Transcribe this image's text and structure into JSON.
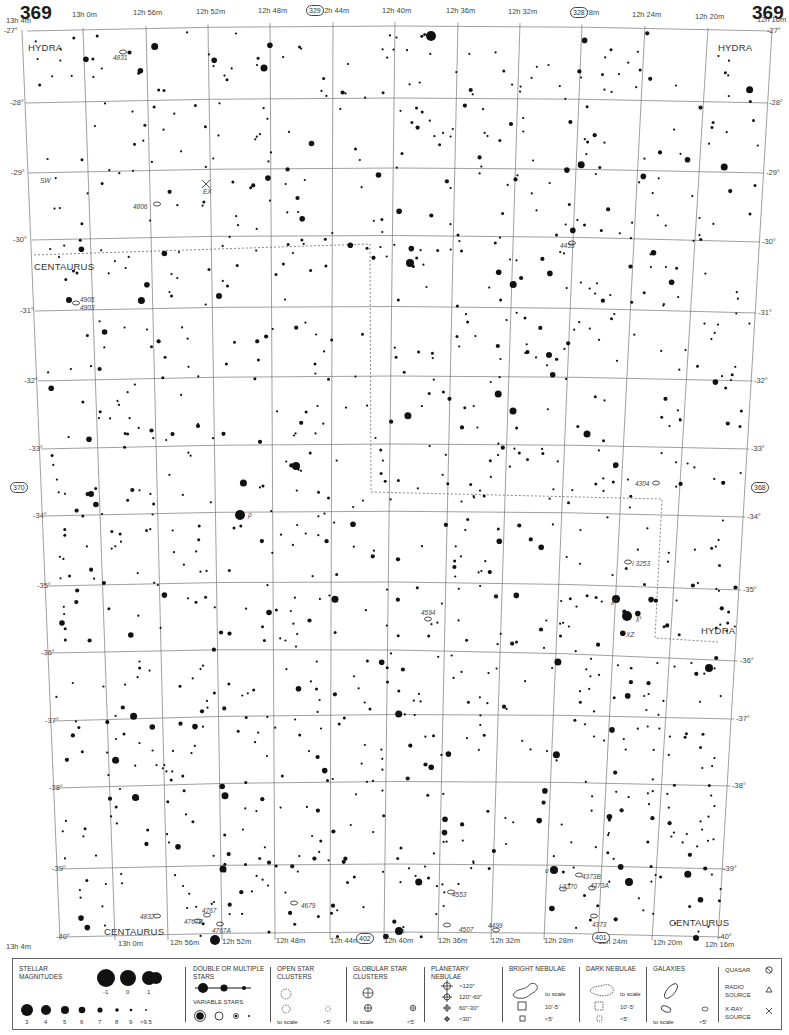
{
  "page": {
    "number_left": "369",
    "number_right": "369"
  },
  "adjacent_charts": [
    {
      "label": "329",
      "x": 314,
      "y": 10
    },
    {
      "label": "328",
      "x": 578,
      "y": 12
    },
    {
      "label": "370",
      "x": 18,
      "y": 487
    },
    {
      "label": "368",
      "x": 759,
      "y": 487
    },
    {
      "label": "402",
      "x": 364,
      "y": 938
    },
    {
      "label": "401",
      "x": 600,
      "y": 937
    }
  ],
  "ra_labels_top": [
    {
      "text": "13h 4m",
      "x": 6,
      "y": 24
    },
    {
      "text": "13h 0m",
      "x": 72,
      "y": 18
    },
    {
      "text": "12h 56m",
      "x": 133,
      "y": 16
    },
    {
      "text": "12h 52m",
      "x": 196,
      "y": 15
    },
    {
      "text": "12h 48m",
      "x": 258,
      "y": 14
    },
    {
      "text": "12h 44m",
      "x": 320,
      "y": 14
    },
    {
      "text": "12h 40m",
      "x": 382,
      "y": 14
    },
    {
      "text": "12h 36m",
      "x": 446,
      "y": 14
    },
    {
      "text": "12h 32m",
      "x": 508,
      "y": 15
    },
    {
      "text": "12h 28m",
      "x": 570,
      "y": 16
    },
    {
      "text": "12h 24m",
      "x": 632,
      "y": 18
    },
    {
      "text": "12h 20m",
      "x": 695,
      "y": 20
    },
    {
      "text": "12h 16m",
      "x": 757,
      "y": 23
    }
  ],
  "ra_labels_bottom": [
    {
      "text": "13h 4m",
      "x": 6,
      "y": 942
    },
    {
      "text": "13h 0m",
      "x": 118,
      "y": 939
    },
    {
      "text": "12h 56m",
      "x": 170,
      "y": 938
    },
    {
      "text": "12h 52m",
      "x": 222,
      "y": 937
    },
    {
      "text": "12h 48m",
      "x": 276,
      "y": 936
    },
    {
      "text": "12h 44m",
      "x": 330,
      "y": 936
    },
    {
      "text": "12h 40m",
      "x": 384,
      "y": 936
    },
    {
      "text": "12h 36m",
      "x": 438,
      "y": 936
    },
    {
      "text": "12h 32m",
      "x": 491,
      "y": 936
    },
    {
      "text": "12h 28m",
      "x": 544,
      "y": 936
    },
    {
      "text": "12h 24m",
      "x": 598,
      "y": 937
    },
    {
      "text": "12h 20m",
      "x": 653,
      "y": 938
    },
    {
      "text": "12h 16m",
      "x": 705,
      "y": 940
    }
  ],
  "dec_labels_left": [
    {
      "text": "-27°",
      "x": 4,
      "y": 31
    },
    {
      "text": "-28°",
      "x": 10,
      "y": 103
    },
    {
      "text": "-29°",
      "x": 11,
      "y": 173
    },
    {
      "text": "-30°",
      "x": 13,
      "y": 240
    },
    {
      "text": "-31°",
      "x": 20,
      "y": 311
    },
    {
      "text": "-32°",
      "x": 24,
      "y": 381
    },
    {
      "text": "-33°",
      "x": 29,
      "y": 449
    },
    {
      "text": "-34°",
      "x": 33,
      "y": 516
    },
    {
      "text": "-35°",
      "x": 37,
      "y": 586
    },
    {
      "text": "-36°",
      "x": 41,
      "y": 653
    },
    {
      "text": "-37°",
      "x": 45,
      "y": 721
    },
    {
      "text": "-38°",
      "x": 49,
      "y": 788
    },
    {
      "text": "-39°",
      "x": 52,
      "y": 869
    },
    {
      "text": "-40°",
      "x": 56,
      "y": 937
    }
  ],
  "dec_labels_right": [
    {
      "text": "-27°",
      "x": 767,
      "y": 31
    },
    {
      "text": "-28°",
      "x": 769,
      "y": 103
    },
    {
      "text": "-29°",
      "x": 766,
      "y": 173
    },
    {
      "text": "-30°",
      "x": 762,
      "y": 242
    },
    {
      "text": "-31°",
      "x": 758,
      "y": 313
    },
    {
      "text": "-32°",
      "x": 754,
      "y": 381
    },
    {
      "text": "-33°",
      "x": 751,
      "y": 449
    },
    {
      "text": "-34°",
      "x": 747,
      "y": 517
    },
    {
      "text": "-35°",
      "x": 743,
      "y": 590
    },
    {
      "text": "-36°",
      "x": 740,
      "y": 661
    },
    {
      "text": "-37°",
      "x": 736,
      "y": 719
    },
    {
      "text": "-38°",
      "x": 732,
      "y": 786
    },
    {
      "text": "-39°",
      "x": 723,
      "y": 869
    },
    {
      "text": "-40°",
      "x": 718,
      "y": 937
    }
  ],
  "constellations": [
    {
      "name": "HYDRA",
      "x": 28,
      "y": 42
    },
    {
      "name": "HYDRA",
      "x": 718,
      "y": 42
    },
    {
      "name": "CENTAURUS",
      "x": 34,
      "y": 261
    },
    {
      "name": "HYDRA",
      "x": 701,
      "y": 625
    },
    {
      "name": "CENTAURUS",
      "x": 104,
      "y": 926
    },
    {
      "name": "CENTAURUS",
      "x": 669,
      "y": 917
    }
  ],
  "objects": [
    {
      "label": "4831",
      "x": 113,
      "y": 54
    },
    {
      "label": "SW",
      "x": 40,
      "y": 177
    },
    {
      "label": "EX",
      "x": 203,
      "y": 188
    },
    {
      "label": "4806",
      "x": 133,
      "y": 203
    },
    {
      "label": "4905",
      "x": 80,
      "y": 296
    },
    {
      "label": "4903",
      "x": 80,
      "y": 304
    },
    {
      "label": "4455",
      "x": 560,
      "y": 242
    },
    {
      "label": "4304",
      "x": 635,
      "y": 480
    },
    {
      "label": "I 3253",
      "x": 632,
      "y": 560
    },
    {
      "label": "ρ",
      "x": 248,
      "y": 511
    },
    {
      "label": "4594",
      "x": 421,
      "y": 609
    },
    {
      "label": "χ²",
      "x": 611,
      "y": 597
    },
    {
      "label": "χ¹",
      "x": 636,
      "y": 614
    },
    {
      "label": "XZ",
      "x": 626,
      "y": 631
    },
    {
      "label": "4679",
      "x": 301,
      "y": 902
    },
    {
      "label": "4832",
      "x": 140,
      "y": 913
    },
    {
      "label": "4767",
      "x": 202,
      "y": 907
    },
    {
      "label": "4767B",
      "x": 184,
      "y": 918
    },
    {
      "label": "4767A",
      "x": 212,
      "y": 927
    },
    {
      "label": "4553",
      "x": 452,
      "y": 891
    },
    {
      "label": "4507",
      "x": 459,
      "y": 926
    },
    {
      "label": "4499",
      "x": 488,
      "y": 922
    },
    {
      "label": "υ",
      "x": 545,
      "y": 867
    },
    {
      "label": "4373B",
      "x": 582,
      "y": 873
    },
    {
      "label": "I 3370",
      "x": 559,
      "y": 883
    },
    {
      "label": "4373A",
      "x": 590,
      "y": 882
    },
    {
      "label": "4373",
      "x": 592,
      "y": 921
    },
    {
      "label": "ι",
      "x": 403,
      "y": 927
    }
  ],
  "legend": {
    "stellar_magnitudes": {
      "title": "STELLAR MAGNITUDES",
      "top_row": [
        "-1",
        "0",
        "1",
        "2"
      ],
      "bottom_row": [
        "3",
        "4",
        "5",
        "6",
        "7",
        "8",
        "9",
        ">9.5"
      ]
    },
    "double_stars": {
      "title": "DOUBLE OR MULTIPLE STARS"
    },
    "variable_stars": {
      "title": "VARIABLE STARS"
    },
    "open_clusters": {
      "title": "OPEN STAR CLUSTERS",
      "to_scale": "to scale",
      "small": "<5'"
    },
    "globular_clusters": {
      "title": "GLOBULAR STAR CLUSTERS",
      "to_scale": "to scale",
      "small": "<5'"
    },
    "planetary_nebulae": {
      "title": "PLANETARY NEBULAE",
      "sizes": [
        ">120\"",
        "120\"-60\"",
        "60\"-30\"",
        "<30\""
      ]
    },
    "bright_nebulae": {
      "title": "BRIGHT NEBULAE",
      "sizes": [
        "to scale",
        "10'-5'",
        "<5'"
      ]
    },
    "dark_nebulae": {
      "title": "DARK NEBULAE",
      "sizes": [
        "to scale",
        "10'-5'",
        "<5'"
      ]
    },
    "galaxies": {
      "title": "GALAXIES",
      "to_scale": "to scale",
      "small": "<5'"
    },
    "quasar": {
      "title": "QUASAR"
    },
    "radio_source": {
      "title": "RADIO SOURCE"
    },
    "xray_source": {
      "title": "X-RAY SOURCE"
    }
  }
}
